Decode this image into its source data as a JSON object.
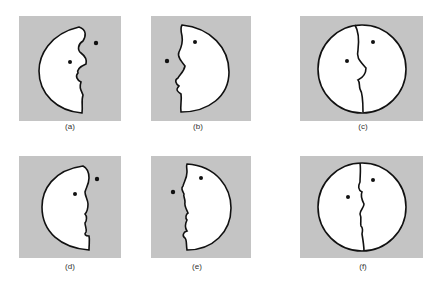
{
  "figure": {
    "background_color": "#c4c4c4",
    "face_fill": "#ffffff",
    "stroke_color": "#111111",
    "panels": [
      {
        "id": "a",
        "label": "(a)",
        "description": "left crescent face profile facing right, with eye dot inside and dot outside"
      },
      {
        "id": "b",
        "label": "(b)",
        "description": "right crescent face profile facing left, with eye dot inside and dot outside"
      },
      {
        "id": "c",
        "label": "(c)",
        "description": "full circle divided by a face profile line, two dots"
      },
      {
        "id": "d",
        "label": "(d)",
        "description": "left crescent with angular profile facing right"
      },
      {
        "id": "e",
        "label": "(e)",
        "description": "right crescent with angular profile facing left"
      },
      {
        "id": "f",
        "label": "(f)",
        "description": "full circle divided by angular profile line, two dots"
      }
    ]
  }
}
